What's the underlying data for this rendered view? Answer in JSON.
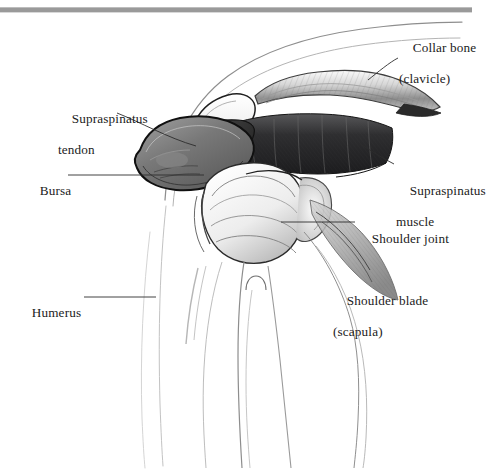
{
  "figure": {
    "style": "grayscale-pencil-drawing",
    "background_color": "#ffffff",
    "ink_color": "#1b1b1b",
    "top_rule_color": "#9a9a9a"
  },
  "labels": [
    {
      "id": "collar-bone",
      "line1": "Collar bone",
      "line2": "(clavicle)",
      "x": 399,
      "y": 24
    },
    {
      "id": "supraspinatus-tendon",
      "line1": "Supraspinatus",
      "line2": "tendon",
      "x": 58,
      "y": 95
    },
    {
      "id": "bursa",
      "line1": "Bursa",
      "line2": "",
      "x": 26,
      "y": 167
    },
    {
      "id": "supraspinatus-muscle",
      "line1": "Supraspinatus",
      "line2": "muscle",
      "x": 396,
      "y": 167
    },
    {
      "id": "shoulder-joint",
      "line1": "Shoulder joint",
      "line2": "",
      "x": 358,
      "y": 215
    },
    {
      "id": "shoulder-blade",
      "line1": "Shoulder blade",
      "line2": "(scapula)",
      "x": 333,
      "y": 277
    },
    {
      "id": "humerus",
      "line1": "Humerus",
      "line2": "",
      "x": 18,
      "y": 289
    }
  ],
  "anatomy_parts": [
    "clavicle",
    "acromion",
    "supraspinatus-muscle",
    "supraspinatus-tendon",
    "subacromial-bursa",
    "humeral-head",
    "humerus-shaft",
    "glenoid",
    "scapula",
    "skin-contour"
  ]
}
